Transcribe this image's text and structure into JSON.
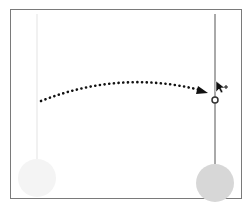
{
  "diagram": {
    "title": "",
    "frame": {
      "border_color": "#7a7a7a",
      "background": "#ffffff"
    },
    "ghost_element": {
      "line_color": "#eeeeee",
      "circle_color": "#f3f3f3",
      "x": 37,
      "line_top": 14,
      "line_bottom": 176,
      "circle_cy": 178,
      "circle_r": 19
    },
    "active_element": {
      "line_color": "#555555",
      "circle_color": "#d6d6d6",
      "x": 215,
      "line_top": 14,
      "line_bottom": 164,
      "circle_cy": 183,
      "circle_r": 19,
      "handle_y": 100
    },
    "drag_path": {
      "style": "dotted",
      "color": "#111111",
      "start": [
        41,
        101
      ],
      "control": [
        120,
        70
      ],
      "end": [
        205,
        92
      ]
    },
    "cursor": {
      "icon": "move-cursor-icon",
      "x": 216,
      "y": 81
    },
    "footer_label": ""
  }
}
